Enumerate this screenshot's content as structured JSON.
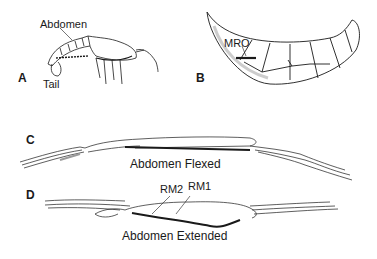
{
  "figure": {
    "panels": [
      {
        "id": "A",
        "letter": "A",
        "labels": {
          "abdomen": "Abdomen",
          "tail": "Tail"
        }
      },
      {
        "id": "B",
        "letter": "B",
        "labels": {
          "mro": "MRO"
        }
      },
      {
        "id": "C",
        "letter": "C",
        "caption": "Abdomen Flexed"
      },
      {
        "id": "D",
        "letter": "D",
        "caption": "Abdomen Extended",
        "labels": {
          "rm2": "RM2",
          "rm1": "RM1"
        }
      }
    ],
    "colors": {
      "ink": "#1a1a1a",
      "shade": "#9a9a9a",
      "background": "#ffffff"
    }
  }
}
